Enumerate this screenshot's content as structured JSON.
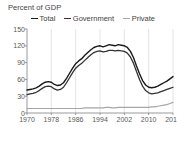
{
  "chart_data": {
    "type": "line",
    "title": "Percent of GDP",
    "xlabel": "",
    "ylabel": "",
    "ylim": [
      0,
      150
    ],
    "xlim": [
      1970,
      2018
    ],
    "yticks": [
      0,
      30,
      60,
      90,
      120,
      150
    ],
    "xticks": [
      1970,
      1978,
      1986,
      1994,
      2002,
      2010,
      2018
    ],
    "grid": "vertical",
    "legend_position": "top",
    "colors": {
      "total": "#1a1a1a",
      "government": "#333333",
      "private": "#a6a6a6",
      "axis": "#808080",
      "gridline": "#d9d9d9",
      "text": "#3f3f3f"
    },
    "x": [
      1970,
      1971,
      1972,
      1973,
      1974,
      1975,
      1976,
      1977,
      1978,
      1979,
      1980,
      1981,
      1982,
      1983,
      1984,
      1985,
      1986,
      1987,
      1988,
      1989,
      1990,
      1991,
      1992,
      1993,
      1994,
      1995,
      1996,
      1997,
      1998,
      1999,
      2000,
      2001,
      2002,
      2003,
      2004,
      2005,
      2006,
      2007,
      2008,
      2009,
      2010,
      2011,
      2012,
      2013,
      2014,
      2015,
      2016,
      2017,
      2018
    ],
    "series": [
      {
        "name": "Total",
        "values": [
          41,
          42,
          43,
          45,
          48,
          52,
          55,
          56,
          55,
          51,
          49,
          50,
          54,
          62,
          71,
          80,
          88,
          93,
          97,
          103,
          108,
          113,
          117,
          119,
          120,
          118,
          120,
          122,
          121,
          120,
          122,
          121,
          120,
          117,
          110,
          99,
          84,
          70,
          58,
          50,
          46,
          45,
          46,
          48,
          51,
          54,
          57,
          61,
          65
        ]
      },
      {
        "name": "Government",
        "values": [
          33,
          34,
          35,
          37,
          40,
          44,
          47,
          48,
          47,
          43,
          41,
          42,
          46,
          54,
          63,
          72,
          80,
          85,
          89,
          94,
          99,
          104,
          108,
          110,
          111,
          109,
          110,
          112,
          112,
          111,
          112,
          111,
          110,
          107,
          100,
          89,
          74,
          60,
          48,
          40,
          36,
          34,
          35,
          36,
          38,
          40,
          42,
          44,
          46
        ]
      },
      {
        "name": "Private",
        "values": [
          8,
          8,
          8,
          8,
          8,
          8,
          8,
          8,
          8,
          8,
          8,
          8,
          8,
          8,
          8,
          8,
          8,
          8,
          8,
          9,
          9,
          9,
          9,
          9,
          9,
          9,
          10,
          10,
          9,
          9,
          10,
          10,
          10,
          10,
          10,
          10,
          10,
          10,
          10,
          10,
          10,
          11,
          11,
          12,
          13,
          14,
          15,
          17,
          19
        ]
      }
    ]
  },
  "legend": {
    "items": [
      {
        "label": "Total",
        "color": "#1a1a1a"
      },
      {
        "label": "Government",
        "color": "#333333"
      },
      {
        "label": "Private",
        "color": "#a6a6a6"
      }
    ]
  }
}
